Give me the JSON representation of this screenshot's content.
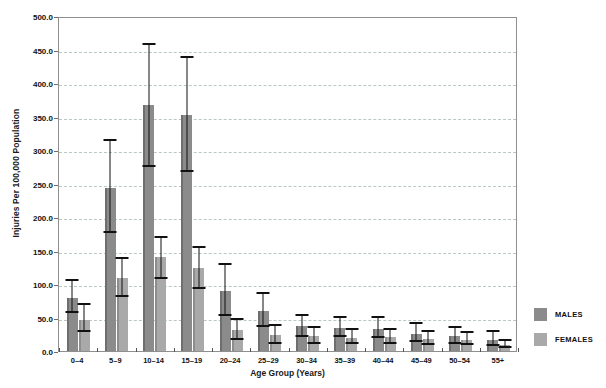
{
  "chart_data": {
    "type": "bar",
    "title": "",
    "xlabel": "Age Group (Years)",
    "ylabel": "Injuries Per 100,000 Population",
    "ylim": [
      0,
      500
    ],
    "ytick_labels": [
      "0.0",
      "50.0",
      "100.0",
      "150.0",
      "200.0",
      "250.0",
      "300.0",
      "350.0",
      "400.0",
      "450.0",
      "500.0"
    ],
    "ytick_values": [
      0,
      50,
      100,
      150,
      200,
      250,
      300,
      350,
      400,
      450,
      500
    ],
    "grid": true,
    "legend_position": "right",
    "categories": [
      "0–4",
      "5–9",
      "10–14",
      "15–19",
      "20–24",
      "25–29",
      "30–34",
      "35–39",
      "40–44",
      "45–49",
      "50–54",
      "55+"
    ],
    "series": [
      {
        "name": "MALES",
        "color": "#8b8b8b",
        "values": [
          79,
          244,
          367,
          353,
          90,
          59,
          38,
          35,
          33,
          26,
          22,
          17
        ],
        "err_low": [
          57,
          176,
          275,
          267,
          53,
          36,
          21,
          21,
          19,
          13,
          11,
          7
        ],
        "err_high": [
          104,
          314,
          456,
          438,
          129,
          85,
          53,
          50,
          49,
          40,
          34,
          28
        ]
      },
      {
        "name": "FEMALES",
        "color": "#a9a9a9",
        "values": [
          47,
          109,
          140,
          124,
          31,
          24,
          22,
          20,
          21,
          18,
          17,
          9
        ],
        "err_low": [
          29,
          80,
          108,
          93,
          16,
          11,
          10,
          11,
          11,
          9,
          9,
          4
        ],
        "err_high": [
          69,
          138,
          169,
          154,
          47,
          38,
          34,
          31,
          32,
          28,
          27,
          15
        ]
      }
    ],
    "legend": [
      {
        "label": "MALES",
        "color": "#8b8b8b"
      },
      {
        "label": "FEMALES",
        "color": "#a9a9a9"
      }
    ]
  }
}
